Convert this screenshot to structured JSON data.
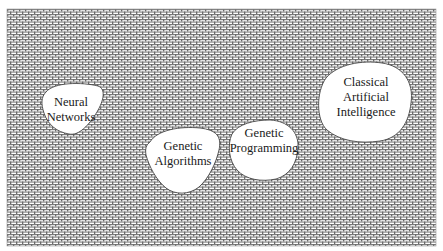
{
  "diagram": {
    "background": {
      "pattern": "crosshatch-mesh",
      "fill_color": "#ffffff",
      "line_color": "#6e6e6e"
    },
    "regions": [
      {
        "id": "neural-networks",
        "lines": [
          "Neural",
          "Networks"
        ]
      },
      {
        "id": "genetic-algorithms",
        "lines": [
          "Genetic",
          "Algorithms"
        ]
      },
      {
        "id": "genetic-programming",
        "lines": [
          "Genetic",
          "Programming"
        ]
      },
      {
        "id": "classical-ai",
        "lines": [
          "Classical",
          "Artificial",
          "Intelligence"
        ]
      }
    ]
  }
}
